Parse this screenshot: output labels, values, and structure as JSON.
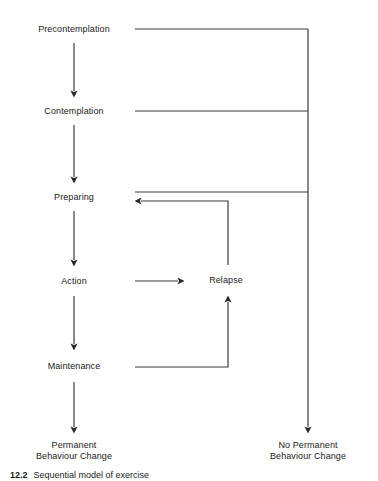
{
  "figure": {
    "type": "flowchart",
    "background_color": "#ffffff",
    "line_color": "#3a3a3a",
    "text_color": "#1a1a1a",
    "caption_number": "12.2",
    "caption_text": "Sequential model of exercise"
  },
  "nodes": [
    {
      "id": "precontemplation",
      "label": "Precontemplation",
      "x": 13,
      "y": 15,
      "w": 122,
      "h": 28
    },
    {
      "id": "contemplation",
      "label": "Contemplation",
      "x": 13,
      "y": 97,
      "w": 122,
      "h": 28
    },
    {
      "id": "preparing",
      "label": "Preparing",
      "x": 13,
      "y": 183,
      "w": 122,
      "h": 28
    },
    {
      "id": "action",
      "label": "Action",
      "x": 13,
      "y": 266,
      "w": 122,
      "h": 30
    },
    {
      "id": "maintenance",
      "label": "Maintenance",
      "x": 13,
      "y": 350,
      "w": 122,
      "h": 32
    },
    {
      "id": "relapse",
      "label": "Relapse",
      "x": 184,
      "y": 265,
      "w": 84,
      "h": 31
    },
    {
      "id": "permanent-behaviour-change",
      "label": "Permanent\nBehaviour Change",
      "x": 13,
      "y": 433,
      "w": 122,
      "h": 35
    },
    {
      "id": "no-permanent-behaviour-change",
      "label": "No Permanent\nBehaviour Change",
      "x": 248,
      "y": 433,
      "w": 120,
      "h": 35
    }
  ],
  "edges": [
    {
      "id": "precontemplation-to-contemplation",
      "from": "precontemplation",
      "to": "contemplation",
      "kind": "arrow-down"
    },
    {
      "id": "contemplation-to-preparing",
      "from": "contemplation",
      "to": "preparing",
      "kind": "arrow-down"
    },
    {
      "id": "preparing-to-action",
      "from": "preparing",
      "to": "action",
      "kind": "arrow-down"
    },
    {
      "id": "action-to-maintenance",
      "from": "action",
      "to": "maintenance",
      "kind": "arrow-down"
    },
    {
      "id": "maintenance-to-permanent",
      "from": "maintenance",
      "to": "permanent-behaviour-change",
      "kind": "arrow-down"
    },
    {
      "id": "action-to-relapse",
      "from": "action",
      "to": "relapse",
      "kind": "arrow-right"
    },
    {
      "id": "maintenance-to-relapse",
      "from": "maintenance",
      "to": "relapse",
      "kind": "arrow-up-elbow"
    },
    {
      "id": "relapse-to-preparing",
      "from": "relapse",
      "to": "preparing",
      "kind": "arrow-left-elbow"
    },
    {
      "id": "precontemplation-to-no-permanent",
      "from": "precontemplation",
      "to": "no-permanent-behaviour-change",
      "kind": "arrow-right-trunk"
    },
    {
      "id": "contemplation-to-no-permanent",
      "from": "contemplation",
      "to": "no-permanent-behaviour-change",
      "kind": "arrow-right-trunk"
    },
    {
      "id": "preparing-to-no-permanent",
      "from": "preparing",
      "to": "no-permanent-behaviour-change",
      "kind": "arrow-right-trunk"
    }
  ]
}
